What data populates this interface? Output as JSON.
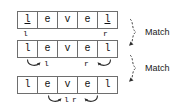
{
  "figure": {
    "type": "palindrome-two-pointer-diagram",
    "word": "level",
    "colors": {
      "box_border": "#6e6e6e",
      "text": "#111111",
      "background": "#ffffff",
      "annotation": "#3a3a3a"
    }
  },
  "rows": [
    {
      "id": "step-1",
      "letters": [
        "l",
        "e",
        "v",
        "e",
        "l"
      ],
      "underlined": [
        0,
        4
      ],
      "pointers": [
        {
          "name": "left-pointer",
          "label": "l",
          "index": 0
        },
        {
          "name": "right-pointer",
          "label": "r",
          "index": 4
        }
      ],
      "arrows": []
    },
    {
      "id": "step-2",
      "letters": [
        "l",
        "e",
        "v",
        "e",
        "l"
      ],
      "underlined": [],
      "pointers": [
        {
          "name": "left-pointer",
          "label": "l",
          "index": 1
        },
        {
          "name": "right-pointer",
          "label": "r",
          "index": 3
        }
      ],
      "arrows": [
        {
          "name": "left-pointer-move-arrow",
          "direction": "right"
        },
        {
          "name": "right-pointer-move-arrow",
          "direction": "left"
        }
      ]
    },
    {
      "id": "step-3",
      "letters": [
        "l",
        "e",
        "v",
        "e",
        "l"
      ],
      "underlined": [],
      "pointers": [
        {
          "name": "left-pointer",
          "label": "l",
          "index": 2
        },
        {
          "name": "right-pointer",
          "label": "r",
          "index": 2
        }
      ],
      "arrows": [
        {
          "name": "left-pointer-move-arrow",
          "direction": "right"
        },
        {
          "name": "right-pointer-move-arrow",
          "direction": "left"
        }
      ]
    }
  ],
  "annotations": [
    {
      "name": "match-label-1",
      "label": "Match",
      "brace": "curly-brace-right"
    },
    {
      "name": "match-label-2",
      "label": "Match",
      "brace": "curly-brace-right"
    }
  ]
}
